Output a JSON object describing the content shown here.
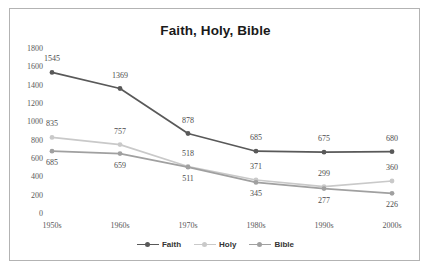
{
  "chart_data": {
    "type": "line",
    "title": "Faith, Holy, Bible",
    "xlabel": "",
    "ylabel": "",
    "categories": [
      "1950s",
      "1960s",
      "1970s",
      "1980s",
      "1990s",
      "2000s"
    ],
    "yticks": [
      1800,
      1600,
      1400,
      1200,
      1000,
      800,
      600,
      400,
      200,
      0
    ],
    "ylim": [
      0,
      1800
    ],
    "grid": false,
    "legend_position": "bottom",
    "data_labels": true,
    "series": [
      {
        "name": "Faith",
        "color": "#595959",
        "values": [
          1545,
          1369,
          878,
          685,
          675,
          680
        ],
        "label_offsets": [
          -14,
          -14,
          -14,
          -14,
          -14,
          -14
        ]
      },
      {
        "name": "Holy",
        "color": "#c9c9c9",
        "values": [
          835,
          757,
          518,
          371,
          299,
          360
        ],
        "label_offsets": [
          -14,
          -14,
          -14,
          -14,
          -14,
          -14
        ]
      },
      {
        "name": "Bible",
        "color": "#a0a0a0",
        "values": [
          685,
          659,
          511,
          345,
          277,
          226
        ],
        "label_offsets": [
          11,
          11,
          11,
          11,
          11,
          11
        ]
      }
    ]
  },
  "frame": {
    "border_color": "#b3b3b3",
    "background": "#ffffff"
  }
}
